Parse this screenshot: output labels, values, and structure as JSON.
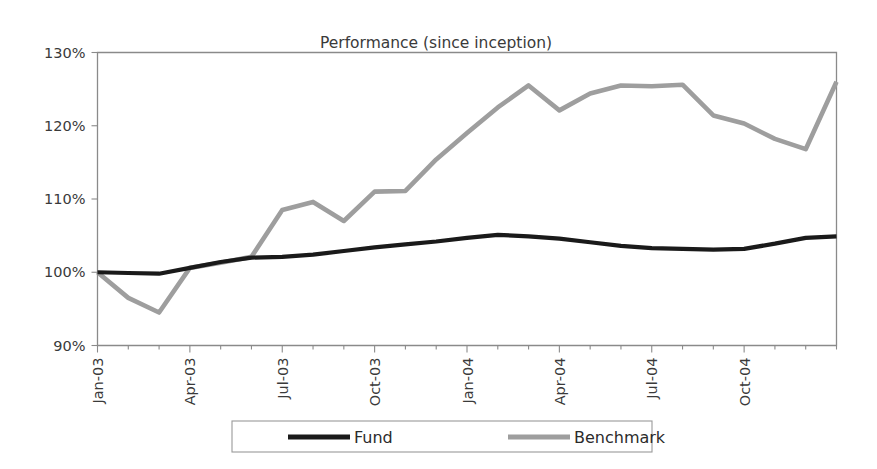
{
  "chart_data": {
    "type": "line",
    "title": "Performance (since inception)",
    "xlabel": "",
    "ylabel": "",
    "ylim": [
      90,
      130
    ],
    "ytick_values": [
      90,
      100,
      110,
      120,
      130
    ],
    "ytick_labels": [
      "90%",
      "100%",
      "110%",
      "120%",
      "130%"
    ],
    "grid": false,
    "legend_position": "bottom",
    "x": [
      "Jan-03",
      "Feb-03",
      "Mar-03",
      "Apr-03",
      "May-03",
      "Jun-03",
      "Jul-03",
      "Aug-03",
      "Sep-03",
      "Oct-03",
      "Nov-03",
      "Dec-03",
      "Jan-04",
      "Feb-04",
      "Mar-04",
      "Apr-04",
      "May-04",
      "Jun-04",
      "Jul-04",
      "Aug-04",
      "Sep-04",
      "Oct-04",
      "Nov-04",
      "Dec-04",
      "Jan-05"
    ],
    "xtick_labels": [
      "Jan-03",
      "Apr-03",
      "Jul-03",
      "Oct-03",
      "Jan-04",
      "Apr-04",
      "Jul-04",
      "Oct-04"
    ],
    "xtick_indices": [
      0,
      3,
      6,
      9,
      12,
      15,
      18,
      21
    ],
    "series": [
      {
        "name": "Fund",
        "color": "#1a1a1a",
        "width": 4.2,
        "values": [
          100.0,
          99.9,
          99.8,
          100.6,
          101.4,
          102.0,
          102.1,
          102.4,
          102.9,
          103.4,
          103.8,
          104.2,
          104.7,
          105.1,
          104.9,
          104.6,
          104.1,
          103.6,
          103.3,
          103.2,
          103.1,
          103.2,
          103.9,
          104.7,
          104.9
        ]
      },
      {
        "name": "Benchmark",
        "color": "#9e9e9e",
        "width": 4.6,
        "values": [
          100.0,
          96.5,
          94.5,
          100.6,
          101.3,
          102.1,
          108.5,
          109.6,
          107.0,
          111.0,
          111.1,
          115.4,
          119.0,
          122.5,
          125.5,
          122.1,
          124.4,
          125.5,
          125.4,
          125.6,
          121.4,
          120.3,
          118.2,
          116.8,
          126.0
        ]
      }
    ]
  },
  "legend": {
    "entries": [
      {
        "label": "Fund"
      },
      {
        "label": "Benchmark"
      }
    ]
  },
  "colors": {
    "fund": "#1a1a1a",
    "benchmark": "#9e9e9e",
    "axis": "#8a8a8a",
    "text": "#3a3a3a",
    "background": "#ffffff"
  }
}
